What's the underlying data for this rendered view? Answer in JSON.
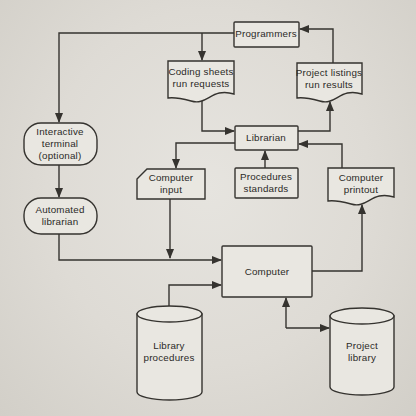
{
  "figure": {
    "colors": {
      "background": "#dedbd5",
      "node_fill": "#e9e7e1",
      "line": "#35332f",
      "text": "#2b2a27"
    }
  },
  "nodes": [
    {
      "id": "programmers",
      "shape": "rect",
      "x": 234,
      "y": 22,
      "w": 65,
      "h": 25,
      "tx": 266,
      "ty": 34,
      "label": [
        "Programmers"
      ]
    },
    {
      "id": "coding-sheets",
      "shape": "document",
      "x": 168,
      "y": 61,
      "w": 66,
      "h": 42,
      "tx": 201,
      "ty": 78,
      "label": [
        "Coding sheets",
        "run requests"
      ]
    },
    {
      "id": "project-listings",
      "shape": "document",
      "x": 297,
      "y": 63,
      "w": 65,
      "h": 40,
      "tx": 329,
      "ty": 79,
      "label": [
        "Project listings",
        "run results"
      ]
    },
    {
      "id": "librarian",
      "shape": "rect",
      "x": 235,
      "y": 126,
      "w": 63,
      "h": 24,
      "tx": 266,
      "ty": 138,
      "label": [
        "Librarian"
      ]
    },
    {
      "id": "interactive-terminal",
      "shape": "stadium",
      "x": 24,
      "y": 123,
      "w": 73,
      "h": 42,
      "tx": 60,
      "ty": 144,
      "label": [
        "Interactive",
        "terminal",
        "(optional)"
      ]
    },
    {
      "id": "automated-librarian",
      "shape": "stadium",
      "x": 24,
      "y": 198,
      "w": 73,
      "h": 36,
      "tx": 60,
      "ty": 216,
      "label": [
        "Automated",
        "librarian"
      ]
    },
    {
      "id": "computer-input",
      "shape": "card",
      "x": 137,
      "y": 169,
      "w": 68,
      "h": 30,
      "tx": 171,
      "ty": 184,
      "label": [
        "Computer",
        "input"
      ]
    },
    {
      "id": "procedures-standards",
      "shape": "rect",
      "x": 235,
      "y": 168,
      "w": 63,
      "h": 30,
      "tx": 266,
      "ty": 183,
      "label": [
        "Procedures",
        "standards"
      ]
    },
    {
      "id": "computer-printout",
      "shape": "document",
      "x": 328,
      "y": 168,
      "w": 66,
      "h": 38,
      "tx": 361,
      "ty": 184,
      "label": [
        "Computer",
        "printout"
      ]
    },
    {
      "id": "computer",
      "shape": "rect",
      "x": 222,
      "y": 246,
      "w": 90,
      "h": 51,
      "tx": 267,
      "ty": 272,
      "label": [
        "Computer"
      ]
    },
    {
      "id": "library-procedures",
      "shape": "cylinder",
      "x": 137,
      "y": 306,
      "w": 65,
      "h": 94,
      "tx": 169,
      "ty": 352,
      "label": [
        "Library",
        "procedures"
      ]
    },
    {
      "id": "project-library",
      "shape": "cylinder",
      "x": 330,
      "y": 308,
      "w": 64,
      "h": 87,
      "tx": 362,
      "ty": 352,
      "label": [
        "Project",
        "library"
      ]
    }
  ],
  "edges": [
    {
      "id": "programmers-to-interactive-terminal",
      "points": [
        [
          234,
          33
        ],
        [
          59,
          33
        ],
        [
          59,
          122
        ]
      ]
    },
    {
      "id": "programmers-to-coding-sheets",
      "points": [
        [
          202,
          33
        ],
        [
          202,
          60
        ]
      ]
    },
    {
      "id": "coding-sheets-to-librarian",
      "points": [
        [
          202,
          98
        ],
        [
          202,
          131
        ],
        [
          234,
          131
        ]
      ]
    },
    {
      "id": "librarian-to-computer-input",
      "points": [
        [
          235,
          143
        ],
        [
          176,
          143
        ],
        [
          176,
          168
        ]
      ]
    },
    {
      "id": "computer-input-to-computer-junction",
      "points": [
        [
          170,
          199
        ],
        [
          170,
          258
        ]
      ]
    },
    {
      "id": "interactive-terminal-to-automated-librarian",
      "points": [
        [
          59,
          165
        ],
        [
          59,
          197
        ]
      ]
    },
    {
      "id": "automated-librarian-to-computer",
      "points": [
        [
          59,
          234
        ],
        [
          59,
          260
        ],
        [
          221,
          260
        ]
      ]
    },
    {
      "id": "library-procedures-to-computer",
      "points": [
        [
          169,
          306
        ],
        [
          169,
          285
        ],
        [
          221,
          285
        ]
      ]
    },
    {
      "id": "librarian-to-project-listings",
      "points": [
        [
          298,
          131
        ],
        [
          330,
          131
        ],
        [
          330,
          102
        ]
      ]
    },
    {
      "id": "project-listings-to-programmers",
      "points": [
        [
          333,
          63
        ],
        [
          333,
          29
        ],
        [
          300,
          29
        ]
      ]
    },
    {
      "id": "procedures-standards-to-librarian",
      "points": [
        [
          265,
          168
        ],
        [
          265,
          151
        ]
      ]
    },
    {
      "id": "computer-printout-to-librarian",
      "points": [
        [
          342,
          168
        ],
        [
          342,
          144
        ],
        [
          299,
          144
        ]
      ]
    },
    {
      "id": "computer-to-computer-printout",
      "points": [
        [
          312,
          271
        ],
        [
          362,
          271
        ],
        [
          362,
          205
        ]
      ]
    },
    {
      "id": "project-library-to-computer",
      "points": [
        [
          286,
          328
        ],
        [
          286,
          298
        ]
      ]
    },
    {
      "id": "computer-to-project-library",
      "points": [
        [
          286,
          328
        ],
        [
          329,
          328
        ]
      ]
    }
  ]
}
